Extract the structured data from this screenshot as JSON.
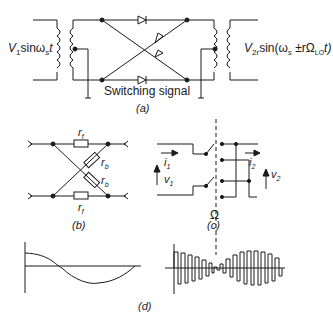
{
  "figure": {
    "panel_a": {
      "input_label_prefix": "V",
      "input_label_sub": "1",
      "input_label_mid": "sinω",
      "input_label_sub2": "s",
      "input_label_end": "t",
      "output_label_prefix": "V",
      "output_label_sub": "2r",
      "output_label_rest": "sin(ω",
      "output_label_sub2": "s",
      "output_label_rest2": " ±rΩ",
      "output_label_sub3": "LO",
      "output_label_end": "t)",
      "switching_label": "Switching signal",
      "caption": "(a)"
    },
    "panel_b": {
      "rf_top": "r",
      "rf_top_sub": "f",
      "rb_upper": "r",
      "rb_upper_sub": "b",
      "rb_lower": "r",
      "rb_lower_sub": "b",
      "rf_bottom": "r",
      "rf_bottom_sub": "f",
      "caption": "(b)"
    },
    "panel_c": {
      "i1": "i",
      "i1_sub": "1",
      "v1": "v",
      "v1_sub": "1",
      "i2": "i",
      "i2_sub": "2",
      "v2": "v",
      "v2_sub": "2",
      "omega": "Ω",
      "caption": "(c)"
    },
    "panel_d": {
      "caption": "(d)"
    }
  }
}
